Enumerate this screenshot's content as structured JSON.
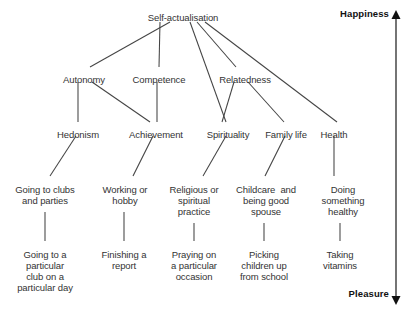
{
  "diagram": {
    "line_color": "#444444",
    "text_color": "#333333",
    "background": "#ffffff",
    "levels": {
      "level1": [
        {
          "id": "self-actualisation",
          "label": "Self-actualisation",
          "x": 183,
          "y": 12
        }
      ],
      "level2": [
        {
          "id": "autonomy",
          "label": "Autonomy",
          "x": 84,
          "y": 74
        },
        {
          "id": "competence",
          "label": "Competence",
          "x": 159,
          "y": 74
        },
        {
          "id": "relatedness",
          "label": "Relatedness",
          "x": 245,
          "y": 74
        }
      ],
      "level3": [
        {
          "id": "hedonism",
          "label": "Hedonism",
          "x": 78,
          "y": 129
        },
        {
          "id": "achievement",
          "label": "Achievement",
          "x": 156,
          "y": 129
        },
        {
          "id": "spirituality",
          "label": "Spirituality",
          "x": 228,
          "y": 129
        },
        {
          "id": "family-life",
          "label": "Family life",
          "x": 286,
          "y": 129
        },
        {
          "id": "health",
          "label": "Health",
          "x": 334,
          "y": 129
        }
      ],
      "level4": [
        {
          "id": "going-to-clubs",
          "label": "Going to clubs\nand parties",
          "x": 45,
          "y": 184
        },
        {
          "id": "working-or-hobby",
          "label": "Working or\nhobby",
          "x": 125,
          "y": 184
        },
        {
          "id": "religious-practice",
          "label": "Religious or\nspiritual\npractice",
          "x": 194,
          "y": 184
        },
        {
          "id": "childcare-spouse",
          "label": "Childcare  and\nbeing good\nspouse",
          "x": 266,
          "y": 184
        },
        {
          "id": "doing-healthy",
          "label": "Doing\nsomething\nhealthy",
          "x": 343,
          "y": 184
        }
      ],
      "level5": [
        {
          "id": "particular-club",
          "label": "Going to a\nparticular\nclub on a\nparticular day",
          "x": 45,
          "y": 249
        },
        {
          "id": "finishing-report",
          "label": "Finishing a\nreport",
          "x": 124,
          "y": 249
        },
        {
          "id": "praying-occasion",
          "label": "Praying on\na particular\noccasion",
          "x": 194,
          "y": 249
        },
        {
          "id": "picking-children",
          "label": "Picking\nchildren up\nfrom school",
          "x": 264,
          "y": 249
        },
        {
          "id": "taking-vitamins",
          "label": "Taking\nvitamins",
          "x": 340,
          "y": 249
        }
      ]
    },
    "edges": [
      {
        "from": "self-actualisation",
        "to": "autonomy",
        "x1": 170,
        "y1": 22,
        "x2": 90,
        "y2": 67
      },
      {
        "from": "self-actualisation",
        "to": "competence",
        "x1": 160,
        "y1": 22,
        "x2": 159,
        "y2": 67
      },
      {
        "from": "self-actualisation",
        "to": "relatedness",
        "x1": 197,
        "y1": 22,
        "x2": 236,
        "y2": 67
      },
      {
        "from": "self-actualisation",
        "to": "spirituality",
        "x1": 190,
        "y1": 22,
        "x2": 226,
        "y2": 122
      },
      {
        "from": "self-actualisation",
        "to": "health",
        "x1": 205,
        "y1": 22,
        "x2": 337,
        "y2": 122
      },
      {
        "from": "autonomy",
        "to": "hedonism",
        "x1": 78,
        "y1": 82,
        "x2": 78,
        "y2": 122
      },
      {
        "from": "autonomy",
        "to": "achievement",
        "x1": 92,
        "y1": 82,
        "x2": 150,
        "y2": 122
      },
      {
        "from": "competence",
        "to": "achievement",
        "x1": 157,
        "y1": 82,
        "x2": 157,
        "y2": 122
      },
      {
        "from": "relatedness",
        "to": "spirituality",
        "x1": 234,
        "y1": 82,
        "x2": 222,
        "y2": 122
      },
      {
        "from": "relatedness",
        "to": "family-life",
        "x1": 248,
        "y1": 82,
        "x2": 284,
        "y2": 122
      },
      {
        "from": "hedonism",
        "to": "going-to-clubs",
        "x1": 76,
        "y1": 136,
        "x2": 50,
        "y2": 176
      },
      {
        "from": "achievement",
        "to": "working-or-hobby",
        "x1": 153,
        "y1": 136,
        "x2": 133,
        "y2": 176
      },
      {
        "from": "spirituality",
        "to": "religious-practice",
        "x1": 226,
        "y1": 136,
        "x2": 203,
        "y2": 176
      },
      {
        "from": "family-life",
        "to": "childcare-spouse",
        "x1": 285,
        "y1": 136,
        "x2": 265,
        "y2": 176
      },
      {
        "from": "health",
        "to": "doing-healthy",
        "x1": 334,
        "y1": 136,
        "x2": 334,
        "y2": 176
      },
      {
        "from": "going-to-clubs",
        "to": "particular-club",
        "x1": 45,
        "y1": 212,
        "x2": 45,
        "y2": 241
      },
      {
        "from": "working-or-hobby",
        "to": "finishing-report",
        "x1": 124,
        "y1": 212,
        "x2": 124,
        "y2": 241
      },
      {
        "from": "religious-practice",
        "to": "praying-occasion",
        "x1": 194,
        "y1": 223,
        "x2": 194,
        "y2": 241
      },
      {
        "from": "childcare-spouse",
        "to": "picking-children",
        "x1": 264,
        "y1": 223,
        "x2": 264,
        "y2": 241
      },
      {
        "from": "doing-healthy",
        "to": "taking-vitamins",
        "x1": 340,
        "y1": 223,
        "x2": 340,
        "y2": 241
      }
    ],
    "axis": {
      "top_label": "Happiness",
      "bottom_label": "Pleasure",
      "line_x": 396,
      "line_top": 18,
      "line_bottom": 297,
      "top_label_x": 389,
      "top_label_y": 8,
      "bottom_label_x": 389,
      "bottom_label_y": 288
    }
  }
}
